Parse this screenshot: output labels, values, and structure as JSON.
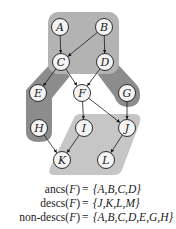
{
  "diagram": {
    "regions": [
      {
        "name": "ancestors-region",
        "color": "#b3b3b3"
      },
      {
        "name": "left-nondesc-band",
        "color": "#8c8c8c"
      },
      {
        "name": "right-nondesc-band",
        "color": "#8c8c8c"
      },
      {
        "name": "descendants-region",
        "color": "#c6c6c6"
      }
    ],
    "nodes": [
      {
        "id": "A",
        "x": 60,
        "y": 27
      },
      {
        "id": "B",
        "x": 104,
        "y": 27
      },
      {
        "id": "C",
        "x": 61,
        "y": 62
      },
      {
        "id": "D",
        "x": 105,
        "y": 62
      },
      {
        "id": "E",
        "x": 38,
        "y": 93
      },
      {
        "id": "F",
        "x": 82,
        "y": 93
      },
      {
        "id": "G",
        "x": 127,
        "y": 93
      },
      {
        "id": "H",
        "x": 39,
        "y": 128
      },
      {
        "id": "I",
        "x": 84,
        "y": 128
      },
      {
        "id": "J",
        "x": 127,
        "y": 128
      },
      {
        "id": "K",
        "x": 62,
        "y": 160
      },
      {
        "id": "L",
        "x": 106,
        "y": 160
      }
    ],
    "edges": [
      [
        "A",
        "C"
      ],
      [
        "B",
        "C"
      ],
      [
        "B",
        "D"
      ],
      [
        "C",
        "E"
      ],
      [
        "C",
        "F"
      ],
      [
        "D",
        "F"
      ],
      [
        "F",
        "I"
      ],
      [
        "F",
        "J"
      ],
      [
        "G",
        "J"
      ],
      [
        "H",
        "K"
      ],
      [
        "I",
        "K"
      ],
      [
        "J",
        "L"
      ]
    ]
  },
  "equations": [
    {
      "lhs_fn": "ancs",
      "lhs_arg": "F",
      "op": "=",
      "rhs": "{A,B,C,D}"
    },
    {
      "lhs_fn": "descs",
      "lhs_arg": "F",
      "op": "=",
      "rhs": "{J,K,L,M}"
    },
    {
      "lhs_fn": "non-descs",
      "lhs_arg": "F",
      "op": "=",
      "rhs": "{A,B,C,D,E,G,H}"
    }
  ]
}
